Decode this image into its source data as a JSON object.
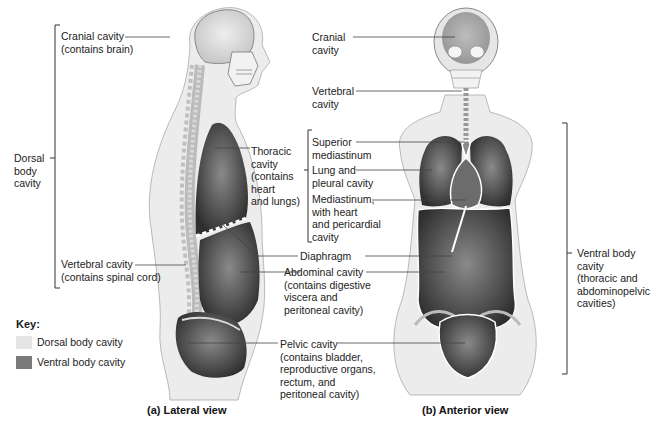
{
  "lateral_view": {
    "caption": "(a) Lateral view",
    "dorsal_bracket_label": "Dorsal\nbody\ncavity",
    "labels": {
      "cranial": "Cranial cavity\n(contains brain)",
      "vertebral": "Vertebral cavity\n(contains spinal cord)",
      "thoracic": "Thoracic\ncavity\n(contains\nheart\nand lungs)",
      "diaphragm": "Diaphragm",
      "abdominal": "Abdominal cavity\n(contains digestive\nviscera and\nperitoneal cavity)",
      "pelvic": "Pelvic cavity\n(contains bladder,\nreproductive organs,\nrectum, and\nperitoneal cavity)"
    }
  },
  "anterior_view": {
    "caption": "(b) Anterior view",
    "labels": {
      "cranial": "Cranial\ncavity",
      "vertebral": "Vertebral\ncavity",
      "superior_mediastinum": "Superior\nmediastinum",
      "lung_pleural": "Lung and\npleural cavity",
      "mediastinum": "Mediastinum,\nwith heart\nand pericardial\ncavity"
    },
    "ventral_bracket_label": "Ventral body\ncavity\n(thoracic and\nabdominopelvic\ncavities)"
  },
  "key": {
    "title": "Key:",
    "items": [
      {
        "label": "Dorsal body cavity",
        "color": "#e4e4e4"
      },
      {
        "label": "Ventral body cavity",
        "color": "#7a7a7a"
      }
    ]
  }
}
